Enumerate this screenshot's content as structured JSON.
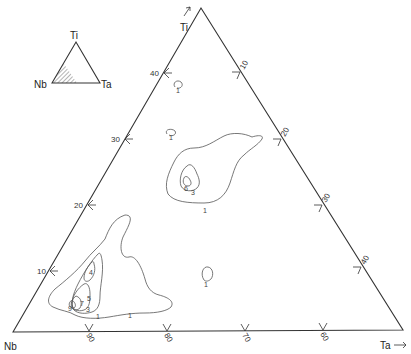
{
  "diagram": {
    "type": "ternary-contour",
    "vertices": {
      "top": "Ti",
      "left": "Nb",
      "right": "Ta"
    },
    "axis_arrows": {
      "top": "Ti ↗",
      "right": "Ta →"
    },
    "inset": {
      "vertices": {
        "top": "Ti",
        "left": "Nb",
        "right": "Ta"
      },
      "note": "hatched sub-triangle at Nb corner"
    },
    "ticks": {
      "left_edge_ti": [
        "40",
        "30",
        "20",
        "10"
      ],
      "right_edge": [
        "10",
        "20",
        "30",
        "40"
      ],
      "bottom_edge": [
        "90",
        "80",
        "70",
        "60"
      ]
    },
    "contour_labels": [
      "1",
      "1",
      "1",
      "3",
      "6",
      "1",
      "1",
      "4",
      "5",
      "7",
      "9",
      "3",
      "1"
    ],
    "colors": {
      "line": "#333333",
      "contour": "#555555",
      "background": "#ffffff"
    }
  }
}
